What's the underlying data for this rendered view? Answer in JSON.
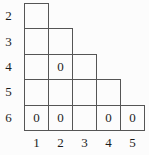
{
  "diagram": {
    "row_labels": [
      "2",
      "3",
      "4",
      "5",
      "6"
    ],
    "col_labels": [
      "1",
      "2",
      "3",
      "4",
      "5"
    ],
    "rows": [
      {
        "label": "2",
        "cells": [
          ""
        ]
      },
      {
        "label": "3",
        "cells": [
          "",
          ""
        ]
      },
      {
        "label": "4",
        "cells": [
          "",
          "0",
          ""
        ]
      },
      {
        "label": "5",
        "cells": [
          "",
          "",
          "",
          ""
        ]
      },
      {
        "label": "6",
        "cells": [
          "0",
          "0",
          "",
          "0",
          "0"
        ]
      }
    ],
    "colors": {
      "background": "#fcfcfc",
      "grid_line": "#555555",
      "text": "#1c1c1c"
    }
  },
  "layout": {
    "cell_width": 24,
    "row_height": 25.4,
    "grid_left": 24,
    "grid_top": 3
  }
}
